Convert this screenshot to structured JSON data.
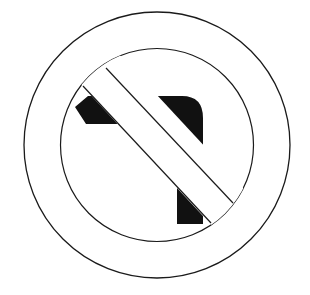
{
  "sign": {
    "name": "No left turn",
    "colors": {
      "background": "#ffffff",
      "stroke": "#1a1a1a",
      "arrow": "#111111"
    }
  }
}
